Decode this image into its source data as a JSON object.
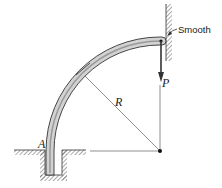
{
  "diagram": {
    "type": "mechanics-free-body",
    "labels": {
      "support": "A",
      "radius": "R",
      "load": "P",
      "wall": "Smooth"
    },
    "colors": {
      "bar_fill": "#d0d0d0",
      "line": "#333333",
      "hatch": "#555555"
    }
  }
}
